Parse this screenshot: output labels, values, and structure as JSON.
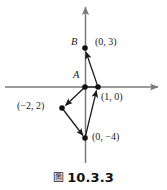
{
  "figure": {
    "caption_glyph": "圖",
    "caption_text": "10.3.3",
    "axis_color": "#7a7a7a",
    "vector_color": "#1a1a1a",
    "point_color": "#111111",
    "background": "#ffffff"
  },
  "axes": {
    "x_axis_name": "x-axis",
    "y_axis_name": "y-axis",
    "origin_px": [
      85,
      87
    ],
    "x_range_px": [
      5,
      163
    ],
    "y_range_px": [
      2,
      163
    ]
  },
  "points": [
    {
      "id": "A",
      "label": "A",
      "label_style": "italic",
      "coords": [
        0,
        0
      ],
      "px": [
        85,
        87
      ],
      "label_px": [
        73,
        74
      ]
    },
    {
      "id": "B",
      "label": "B",
      "label_style": "italic",
      "coords": [
        0,
        3
      ],
      "px": [
        85,
        48
      ],
      "label_px": [
        71,
        41
      ]
    },
    {
      "id": "P03",
      "label": "(0, 3)",
      "label_style": "normal",
      "coords": [
        0,
        3
      ],
      "px": [
        85,
        48
      ],
      "label_px": [
        95,
        41
      ]
    },
    {
      "id": "P10",
      "label": "(1, 0)",
      "label_style": "normal",
      "coords": [
        1,
        0
      ],
      "px": [
        98,
        87
      ],
      "label_px": [
        102,
        94
      ]
    },
    {
      "id": "Pm22",
      "label": "(−2, 2)",
      "label_style": "normal",
      "coords": [
        -2,
        2
      ],
      "px": [
        62,
        108
      ],
      "label_px": [
        17,
        104
      ]
    },
    {
      "id": "P0m4",
      "label": "(0, −4)",
      "label_style": "normal",
      "coords": [
        0,
        -4
      ],
      "px": [
        85,
        138
      ],
      "label_px": [
        93,
        135
      ]
    }
  ],
  "vectors": [
    {
      "id": "v-a-to-m22",
      "from": "A",
      "to": "Pm22",
      "arrowhead_at": "to"
    },
    {
      "id": "v-m22-to-0m4",
      "from": "Pm22",
      "to": "P0m4",
      "arrowhead_at": "to"
    },
    {
      "id": "v-0m4-to-10",
      "from": "P0m4",
      "to": "P10",
      "arrowhead_at": "to"
    },
    {
      "id": "v-10-to-b",
      "from": "P10",
      "to": "B",
      "arrowhead_at": "to"
    },
    {
      "id": "v-a-to-10",
      "from": "A",
      "to": "P10",
      "arrowhead_at": "none"
    }
  ]
}
